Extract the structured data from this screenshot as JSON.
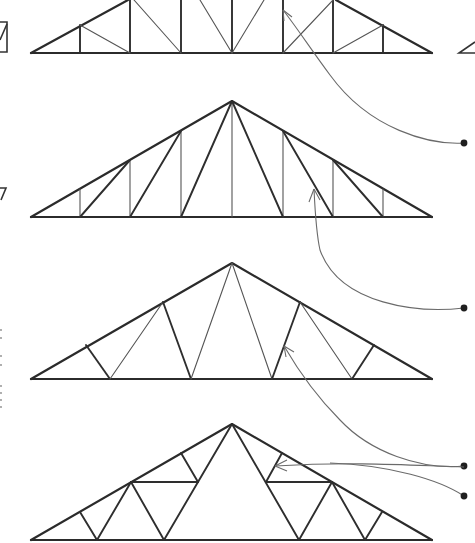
{
  "diagram": {
    "title": "",
    "colors": {
      "line": "#2b2b2b",
      "web_light": "#555555",
      "leader": "#6a6a6a",
      "background": "#ffffff"
    },
    "trusses": [
      {
        "id": "truss-1",
        "label": "",
        "description": "Pratt/Howe style truss with vertical and diagonal webs (top cropped)"
      },
      {
        "id": "truss-2",
        "label": "",
        "description": "Fink-style truss with verticals and diagonals (peak at centre)"
      },
      {
        "id": "truss-3",
        "label": "",
        "description": "W (Fink) truss with zig-zag webs"
      },
      {
        "id": "truss-4",
        "label": "",
        "description": "Fan / double-W truss with horizontal strut"
      }
    ],
    "callouts": [
      {
        "id": "callout-1",
        "label": "",
        "target": "truss-1 web member"
      },
      {
        "id": "callout-2",
        "label": "",
        "target": "truss-2 diagonal web"
      },
      {
        "id": "callout-3",
        "label": "",
        "target": "truss-3 web"
      },
      {
        "id": "callout-4",
        "label": "",
        "target": "truss-4 web"
      },
      {
        "id": "callout-5",
        "label": "",
        "target": "truss-4 web (second leader)"
      }
    ]
  }
}
